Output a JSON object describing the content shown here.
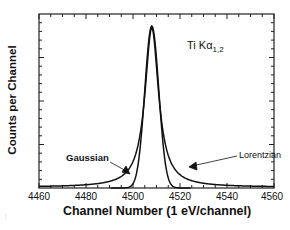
{
  "chart_data": {
    "type": "line",
    "title": "",
    "annotation": {
      "element": "Ti",
      "line": "Kα",
      "subscript": "1,2"
    },
    "xlabel": "Channel Number (1 eV/channel)",
    "ylabel": "Counts per Channel",
    "xlim": [
      4460,
      4560
    ],
    "ylim": [
      0,
      1
    ],
    "x_ticks": [
      4460,
      4480,
      4500,
      4520,
      4540,
      4560
    ],
    "x_tick_labels": [
      "4460",
      "4480",
      "4500",
      "4520",
      "4540",
      "4560"
    ],
    "y_tick_labels": [],
    "grid": false,
    "legend": "inline annotations with arrows",
    "series": [
      {
        "name": "Gaussian",
        "center": 4508,
        "fwhm": 7,
        "x": [
          4490,
          4495,
          4500,
          4503,
          4505,
          4507,
          4508,
          4509,
          4511,
          4513,
          4516,
          4520,
          4524
        ],
        "values": [
          0.0,
          0.05,
          0.27,
          0.55,
          0.78,
          0.97,
          1.0,
          0.97,
          0.78,
          0.55,
          0.27,
          0.05,
          0.0
        ]
      },
      {
        "name": "Lorentzian",
        "center": 4508,
        "fwhm": 7,
        "x": [
          4460,
          4470,
          4480,
          4490,
          4495,
          4500,
          4503,
          4505,
          4507,
          4508,
          4509,
          4511,
          4513,
          4516,
          4520,
          4525,
          4530,
          4540,
          4550,
          4560
        ],
        "values": [
          0.01,
          0.03,
          0.05,
          0.11,
          0.19,
          0.35,
          0.55,
          0.72,
          0.95,
          1.0,
          0.95,
          0.72,
          0.55,
          0.35,
          0.19,
          0.11,
          0.07,
          0.04,
          0.02,
          0.01
        ]
      }
    ]
  },
  "labels": {
    "gaussian": "Gaussian",
    "lorentzian": "Lorentzian",
    "title_main": "Ti Kα",
    "title_sub": "1,2",
    "xlabel": "Channel Number (1 eV/channel)",
    "ylabel": "Counts per Channel",
    "ticks": [
      "4460",
      "4480",
      "4500",
      "4520",
      "4540",
      "4560"
    ],
    "edge_fragment": "…"
  }
}
